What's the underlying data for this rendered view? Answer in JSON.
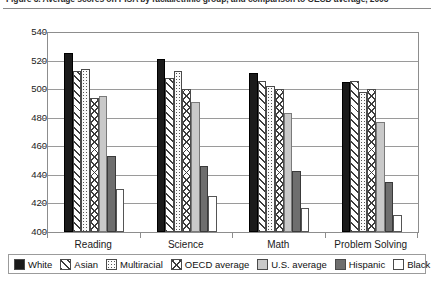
{
  "figure": {
    "title_clipped": "Figure 3. Average scores on PISA by racial/ethnic group, and comparison to OECD average, 2003",
    "title_visible_note": "clipped at top edge"
  },
  "legend": {
    "items": [
      {
        "label": "White",
        "key": "white",
        "swatch": "solid-black-swatch"
      },
      {
        "label": "Asian",
        "key": "asian",
        "swatch": "diagonal-hatch-swatch"
      },
      {
        "label": "Multiracial",
        "key": "multiracial",
        "swatch": "dotted-swatch"
      },
      {
        "label": "OECD average",
        "key": "oecd",
        "swatch": "cross-hatch-swatch"
      },
      {
        "label": "U.S. average",
        "key": "us",
        "swatch": "light-gray-swatch"
      },
      {
        "label": "Hispanic",
        "key": "hispanic",
        "swatch": "dark-gray-swatch"
      },
      {
        "label": "Black",
        "key": "black",
        "swatch": "white-swatch"
      }
    ]
  },
  "chart_data": {
    "type": "bar",
    "title": "Average scores on PISA by racial/ethnic group, and comparison to OECD average, 2003",
    "xlabel": "",
    "ylabel": "",
    "ylim": [
      400,
      540
    ],
    "yticks": [
      400,
      420,
      440,
      460,
      480,
      500,
      520,
      540
    ],
    "grid": true,
    "legend_position": "bottom",
    "categories": [
      "Reading",
      "Science",
      "Math",
      "Problem Solving"
    ],
    "series": [
      {
        "name": "White",
        "values": [
          525,
          521,
          511,
          505
        ]
      },
      {
        "name": "Asian",
        "values": [
          513,
          508,
          506,
          506
        ]
      },
      {
        "name": "Multiracial",
        "values": [
          514,
          513,
          502,
          498
        ]
      },
      {
        "name": "OECD average",
        "values": [
          494,
          500,
          500,
          500
        ]
      },
      {
        "name": "U.S. average",
        "values": [
          495,
          491,
          483,
          477
        ]
      },
      {
        "name": "Hispanic",
        "values": [
          453,
          446,
          443,
          435
        ]
      },
      {
        "name": "Black",
        "values": [
          430,
          425,
          417,
          412
        ]
      }
    ]
  }
}
